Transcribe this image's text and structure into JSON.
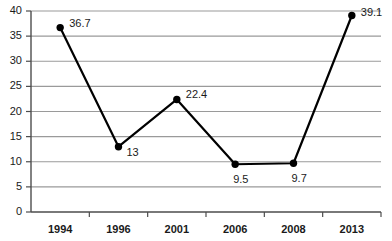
{
  "chart_data": {
    "type": "line",
    "title": "",
    "subtitle": "",
    "xlabel": "",
    "ylabel": "",
    "categories": [
      "1994",
      "1996",
      "2001",
      "2006",
      "2008",
      "2013"
    ],
    "values": [
      36.7,
      13,
      22.4,
      9.5,
      9.7,
      39.1
    ],
    "point_labels": [
      "36.7",
      "13",
      "22.4",
      "9.5",
      "9.7",
      "39.1"
    ],
    "series": [
      {
        "name": "",
        "values": [
          36.7,
          13,
          22.4,
          9.5,
          9.7,
          39.1
        ]
      }
    ],
    "ylim": [
      0,
      40
    ],
    "ytick_labels": [
      "0",
      "5",
      "10",
      "15",
      "20",
      "25",
      "30",
      "35",
      "40"
    ],
    "ytick_values": [
      0,
      5,
      10,
      15,
      20,
      25,
      30,
      35,
      40
    ],
    "xtick_labels": [
      "1994",
      "1996",
      "2001",
      "2006",
      "2008",
      "2013"
    ],
    "grid": true,
    "grid_axis": "y",
    "legend": false,
    "legend_position": "none",
    "marker": "circle",
    "colors": {
      "line": "#000000",
      "marker": "#000000",
      "grid": "#9a9a9a",
      "axis": "#4d4d4d",
      "text": "#1a1a1a",
      "background": "#ffffff"
    }
  }
}
